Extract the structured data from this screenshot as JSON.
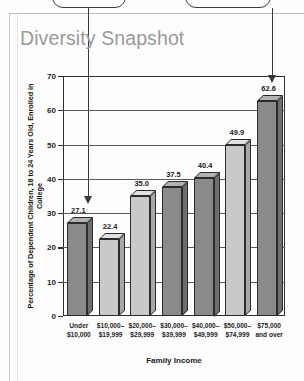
{
  "page": {
    "title": "Diversity Snapshot"
  },
  "annotations": {
    "callout_left_name": "callout-arrow-left",
    "callout_right_name": "callout-arrow-right"
  },
  "chart_data": {
    "type": "bar",
    "title": "Diversity Snapshot",
    "xlabel": "Family Income",
    "ylabel": "Percentage of Dependent Children, 18 to 24 Years Old, Enrolled in College",
    "categories": [
      "Under\n$10,000",
      "$10,000–\n$19,999",
      "$20,000–\n$29,999",
      "$30,000–\n$39,999",
      "$40,000–\n$49,999",
      "$50,000–\n$74,999",
      "$75,000\nand over"
    ],
    "category_lines": [
      [
        "Under",
        "$10,000"
      ],
      [
        "$10,000–",
        "$19,999"
      ],
      [
        "$20,000–",
        "$29,999"
      ],
      [
        "$30,000–",
        "$39,999"
      ],
      [
        "$40,000–",
        "$49,999"
      ],
      [
        "$50,000–",
        "$74,999"
      ],
      [
        "$75,000",
        "and over"
      ]
    ],
    "values": [
      27.1,
      22.4,
      35.0,
      37.5,
      40.4,
      49.9,
      62.6
    ],
    "value_labels": [
      "27.1",
      "22.4",
      "35.0",
      "37.5",
      "40.4",
      "49.9",
      "62.6"
    ],
    "bar_shades": [
      "dark",
      "light",
      "light",
      "dark",
      "dark",
      "light",
      "dark"
    ],
    "ylim": [
      0,
      70
    ],
    "yticks": [
      0,
      10,
      20,
      30,
      40,
      50,
      60,
      70
    ],
    "ytick_labels": [
      "0",
      "10",
      "20",
      "30",
      "40",
      "50",
      "60",
      "70"
    ],
    "grid": true,
    "legend": "none"
  },
  "colors": {
    "bar_dark": "#8a8a8a",
    "bar_light": "#c9c9c9",
    "bar_dark_top": "#b2b2b2",
    "bar_light_top": "#e0e0e0",
    "bar_dark_side": "#6e6e6e",
    "bar_light_side": "#a8a8a8",
    "axis": "#2f2f2f",
    "title": "#9a9a9a",
    "page_background": "#fdfdfd"
  }
}
